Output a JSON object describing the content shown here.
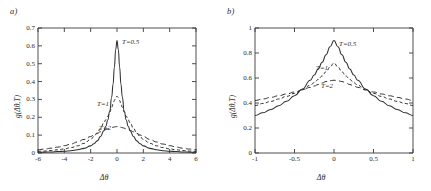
{
  "figure": {
    "panels": [
      {
        "label": "a)",
        "xlabel": "Δθ",
        "ylabel": "g(Δθ,T)",
        "xticks": [
          "-6",
          "-4",
          "-2",
          "0",
          "2",
          "4",
          "6"
        ],
        "yticks": [
          "0",
          "0.1",
          "0.2",
          "0.3",
          "0.4",
          "0.5",
          "0.6",
          "0.7"
        ],
        "curve_labels": [
          "T=0.5",
          "T=1",
          "T=2"
        ]
      },
      {
        "label": "b)",
        "xlabel": "Δθ",
        "ylabel": "g(Δθ,T)",
        "xticks": [
          "-1",
          "-0.5",
          "0",
          "0.5",
          "1"
        ],
        "yticks": [
          "0",
          "0.2",
          "0.4",
          "0.6",
          "0.8",
          "1"
        ],
        "curve_labels": [
          "T=0.5",
          "T=1",
          "T=2"
        ]
      }
    ]
  },
  "chart_data": [
    {
      "type": "line",
      "title": "a)",
      "xlabel": "Δθ",
      "ylabel": "g(Δθ,T)",
      "xlim": [
        -6,
        6
      ],
      "ylim": [
        0,
        0.7
      ],
      "xticks": [
        -6,
        -4,
        -2,
        0,
        2,
        4,
        6
      ],
      "yticks": [
        0,
        0.1,
        0.2,
        0.3,
        0.4,
        0.5,
        0.6,
        0.7
      ],
      "grid": false,
      "legend": "inline-annotations",
      "x": [
        -6,
        -5.5,
        -5,
        -4.5,
        -4,
        -3.5,
        -3,
        -2.5,
        -2,
        -1.75,
        -1.5,
        -1.25,
        -1,
        -0.85,
        -0.7,
        -0.55,
        -0.4,
        -0.3,
        -0.2,
        -0.1,
        0,
        0.1,
        0.2,
        0.3,
        0.4,
        0.55,
        0.7,
        0.85,
        1,
        1.25,
        1.5,
        1.75,
        2,
        2.5,
        3,
        3.5,
        4,
        4.5,
        5,
        5.5,
        6
      ],
      "series": [
        {
          "name": "T=0.5",
          "style": "solid",
          "values": [
            0.004,
            0.005,
            0.006,
            0.008,
            0.01,
            0.013,
            0.018,
            0.026,
            0.04,
            0.052,
            0.068,
            0.092,
            0.125,
            0.15,
            0.185,
            0.235,
            0.315,
            0.385,
            0.48,
            0.58,
            0.63,
            0.58,
            0.48,
            0.385,
            0.315,
            0.235,
            0.185,
            0.15,
            0.125,
            0.092,
            0.068,
            0.052,
            0.04,
            0.026,
            0.018,
            0.013,
            0.01,
            0.008,
            0.006,
            0.005,
            0.004
          ]
        },
        {
          "name": "T=1",
          "style": "dashed-short",
          "values": [
            0.009,
            0.011,
            0.014,
            0.018,
            0.023,
            0.03,
            0.04,
            0.054,
            0.076,
            0.092,
            0.112,
            0.138,
            0.168,
            0.186,
            0.206,
            0.229,
            0.256,
            0.275,
            0.294,
            0.31,
            0.318,
            0.31,
            0.294,
            0.275,
            0.256,
            0.229,
            0.206,
            0.186,
            0.168,
            0.138,
            0.112,
            0.092,
            0.076,
            0.054,
            0.04,
            0.03,
            0.023,
            0.018,
            0.014,
            0.011,
            0.009
          ]
        },
        {
          "name": "T=2",
          "style": "dashed-long",
          "values": [
            0.018,
            0.022,
            0.027,
            0.033,
            0.041,
            0.05,
            0.062,
            0.076,
            0.092,
            0.101,
            0.11,
            0.119,
            0.127,
            0.131,
            0.135,
            0.139,
            0.142,
            0.144,
            0.146,
            0.147,
            0.148,
            0.147,
            0.146,
            0.144,
            0.142,
            0.139,
            0.135,
            0.131,
            0.127,
            0.119,
            0.11,
            0.101,
            0.092,
            0.076,
            0.062,
            0.05,
            0.041,
            0.033,
            0.027,
            0.022,
            0.018
          ]
        }
      ]
    },
    {
      "type": "line",
      "title": "b)",
      "xlabel": "Δθ",
      "ylabel": "g(Δθ,T)",
      "xlim": [
        -1,
        1
      ],
      "ylim": [
        0,
        1
      ],
      "xticks": [
        -1,
        -0.5,
        0,
        0.5,
        1
      ],
      "yticks": [
        0,
        0.2,
        0.4,
        0.6,
        0.8,
        1
      ],
      "grid": false,
      "legend": "inline-annotations",
      "x": [
        -1,
        -0.9,
        -0.8,
        -0.7,
        -0.6,
        -0.5,
        -0.4,
        -0.3,
        -0.25,
        -0.2,
        -0.15,
        -0.1,
        -0.05,
        0,
        0.05,
        0.1,
        0.15,
        0.2,
        0.25,
        0.3,
        0.4,
        0.5,
        0.6,
        0.7,
        0.8,
        0.9,
        1
      ],
      "series": [
        {
          "name": "T=0.5",
          "style": "solid",
          "values": [
            0.3,
            0.322,
            0.348,
            0.378,
            0.414,
            0.458,
            0.512,
            0.582,
            0.624,
            0.672,
            0.726,
            0.786,
            0.85,
            0.9,
            0.85,
            0.786,
            0.726,
            0.672,
            0.624,
            0.582,
            0.512,
            0.458,
            0.414,
            0.378,
            0.348,
            0.322,
            0.3
          ]
        },
        {
          "name": "T=1",
          "style": "dashed-short",
          "values": [
            0.38,
            0.396,
            0.413,
            0.432,
            0.453,
            0.477,
            0.506,
            0.542,
            0.563,
            0.588,
            0.616,
            0.65,
            0.688,
            0.72,
            0.688,
            0.65,
            0.616,
            0.588,
            0.563,
            0.542,
            0.506,
            0.477,
            0.453,
            0.432,
            0.413,
            0.396,
            0.38
          ]
        },
        {
          "name": "T=2",
          "style": "dashed-long",
          "values": [
            0.42,
            0.432,
            0.445,
            0.458,
            0.472,
            0.488,
            0.505,
            0.525,
            0.536,
            0.548,
            0.56,
            0.572,
            0.578,
            0.582,
            0.578,
            0.572,
            0.56,
            0.548,
            0.536,
            0.525,
            0.505,
            0.488,
            0.472,
            0.458,
            0.445,
            0.432,
            0.42
          ]
        }
      ]
    }
  ]
}
